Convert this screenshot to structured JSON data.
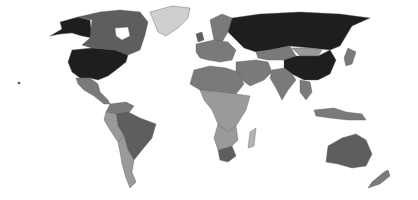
{
  "map": {
    "type": "choropleth",
    "projection": "world-equirectangular",
    "caption": "",
    "shade_levels": {
      "darkest": "#1e1e1e",
      "dark": "#5e5e5e",
      "medium": "#7a7a7a",
      "light": "#9a9a9a",
      "lighter": "#b4b4b4",
      "lightest": "#cfcfcf"
    },
    "regions": [
      {
        "name": "United States",
        "shade": "darkest"
      },
      {
        "name": "Alaska",
        "shade": "darkest"
      },
      {
        "name": "Russia",
        "shade": "darkest"
      },
      {
        "name": "China",
        "shade": "darkest"
      },
      {
        "name": "Canada",
        "shade": "dark"
      },
      {
        "name": "Greenland",
        "shade": "lightest"
      },
      {
        "name": "Mexico",
        "shade": "medium"
      },
      {
        "name": "Brazil",
        "shade": "dark"
      },
      {
        "name": "Australia",
        "shade": "dark"
      },
      {
        "name": "Kazakhstan",
        "shade": "medium"
      },
      {
        "name": "Mongolia",
        "shade": "light"
      },
      {
        "name": "India",
        "shade": "medium"
      },
      {
        "name": "South Africa",
        "shade": "dark"
      },
      {
        "name": "Madagascar",
        "shade": "lighter"
      },
      {
        "name": "Argentina",
        "shade": "light"
      },
      {
        "name": "Europe",
        "shade": "medium"
      },
      {
        "name": "Africa",
        "shade": "light"
      },
      {
        "name": "Middle East",
        "shade": "medium"
      },
      {
        "name": "Southeast Asia",
        "shade": "medium"
      },
      {
        "name": "New Zealand",
        "shade": "medium"
      }
    ]
  }
}
